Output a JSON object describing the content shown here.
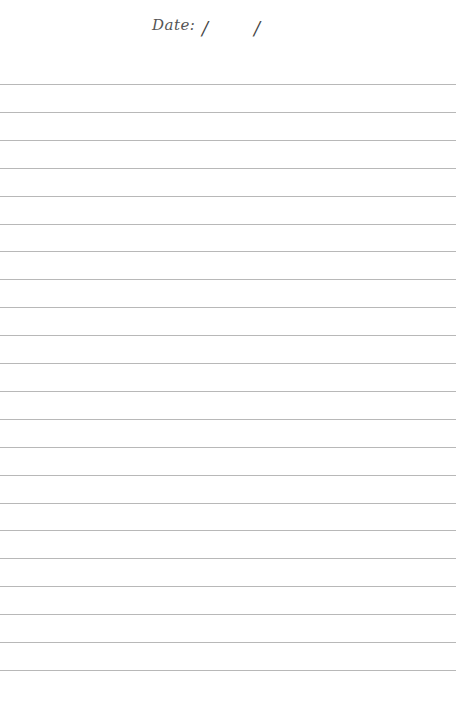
{
  "page": {
    "date_label": "Date:",
    "date_separator_1": "/",
    "date_separator_2": "/",
    "ruled_lines": {
      "count": 22,
      "first_y": 84,
      "spacing": 27.9,
      "color": "#b8b8b8"
    }
  }
}
